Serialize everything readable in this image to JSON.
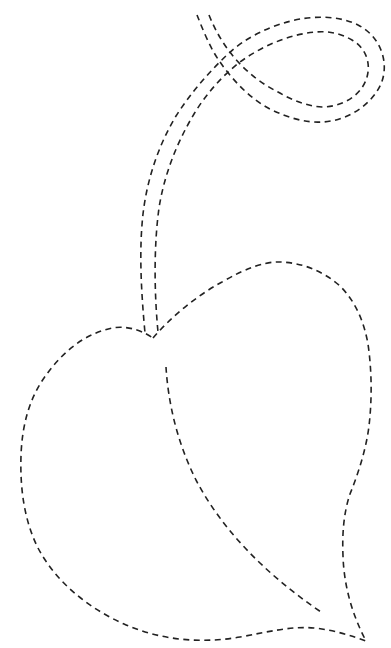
{
  "worksheet": {
    "title": "Leaf tracing worksheet",
    "description": "Dashed-line tracing outline of a heart-shaped leaf with a looped double-line stem and a dashed midrib",
    "stroke_color": "#222222",
    "background_color": "#ffffff",
    "parts": [
      {
        "name": "stem-outer-line"
      },
      {
        "name": "stem-inner-line"
      },
      {
        "name": "leaf-outline"
      },
      {
        "name": "leaf-midrib"
      }
    ]
  }
}
